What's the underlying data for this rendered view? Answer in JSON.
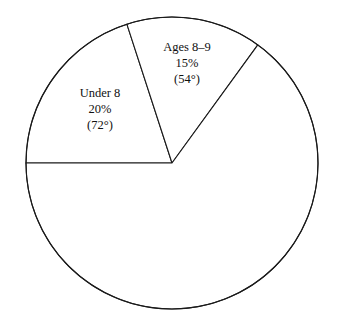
{
  "chart_data": {
    "type": "pie",
    "title": "",
    "subtitle": "",
    "xlabel": "",
    "ylabel": "",
    "grid": false,
    "legend_position": "none",
    "total_degrees": 360,
    "start_angle_deg": 180,
    "direction": "clockwise",
    "categories": [
      "Under 8",
      "Ages 8–9",
      ""
    ],
    "values": [
      20,
      15,
      65
    ],
    "angles_deg": [
      72,
      54,
      234
    ],
    "labels_shown": [
      true,
      true,
      false
    ],
    "slices": [
      {
        "name": "Under 8",
        "percent": 20,
        "percent_text": "20%",
        "angle_deg": 72,
        "angle_text": "(72°)",
        "labelled": true,
        "fill": "#ffffff",
        "stroke": "#1a1a1a"
      },
      {
        "name": "Ages 8–9",
        "percent": 15,
        "percent_text": "15%",
        "angle_deg": 54,
        "angle_text": "(54°)",
        "labelled": true,
        "fill": "#ffffff",
        "stroke": "#1a1a1a"
      },
      {
        "name": "",
        "percent": 65,
        "percent_text": "",
        "angle_deg": 234,
        "angle_text": "",
        "labelled": false,
        "fill": "#ffffff",
        "stroke": "#1a1a1a"
      }
    ]
  },
  "figure": {
    "background_color": "#ffffff",
    "stroke_color": "#1a1a1a",
    "text_color": "#111111",
    "center_x": 172,
    "center_y": 163,
    "radius": 146
  },
  "labels": {
    "under8": {
      "name": "Under 8",
      "percent": "20%",
      "degrees": "(72°)"
    },
    "ages89": {
      "name": "Ages 8–9",
      "percent": "15%",
      "degrees": "(54°)"
    }
  }
}
